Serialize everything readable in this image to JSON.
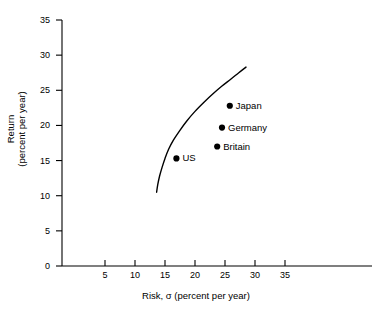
{
  "chart_data": {
    "type": "scatter",
    "title": "",
    "xlabel": "Risk, σ (percent per year)",
    "ylabel_line1": "Return",
    "ylabel_line2": "(percent per year)",
    "xlim": [
      0,
      35
    ],
    "ylim": [
      0,
      35
    ],
    "xticks": [
      5,
      10,
      15,
      20,
      25,
      30,
      35
    ],
    "yticks": [
      0,
      5,
      10,
      15,
      20,
      25,
      30,
      35
    ],
    "xtick_labels": [
      "5",
      "10",
      "15",
      "20",
      "25",
      "30",
      "35"
    ],
    "ytick_labels": [
      "0",
      "5",
      "10",
      "15",
      "20",
      "25",
      "30",
      "35"
    ],
    "grid": false,
    "legend": "none",
    "line_color": "#000000",
    "marker_color": "#000000",
    "axis_color": "#000000",
    "background": "#ffffff",
    "points": [
      {
        "label": "US",
        "x": 16.9,
        "y": 15.3
      },
      {
        "label": "Britain",
        "x": 23.7,
        "y": 17.0
      },
      {
        "label": "Germany",
        "x": 24.5,
        "y": 19.7
      },
      {
        "label": "Japan",
        "x": 25.8,
        "y": 22.8
      }
    ],
    "series": [
      {
        "name": "efficient frontier",
        "type": "line",
        "x": [
          13.6,
          13.8,
          14.1,
          14.5,
          15.0,
          15.6,
          16.4,
          17.4,
          18.6,
          20.0,
          21.5,
          23.0,
          24.5,
          26.0,
          27.3,
          28.5
        ],
        "y": [
          10.5,
          11.6,
          12.8,
          14.0,
          15.3,
          16.6,
          17.9,
          19.2,
          20.6,
          22.0,
          23.3,
          24.5,
          25.6,
          26.6,
          27.5,
          28.3
        ]
      }
    ]
  }
}
